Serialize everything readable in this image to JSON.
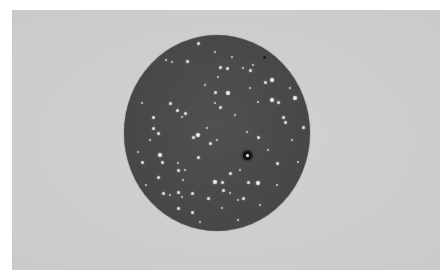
{
  "image": {
    "description": "Black-and-white photograph of a culture plate showing scattered white colonies on a dark circular medium",
    "colors": {
      "page_background": "#ffffff",
      "photo_background": "#cfcfcd",
      "plate": "#4a4a4a",
      "colony": "#eaeaea",
      "dark_spot": "#111111"
    },
    "plate": {
      "center_x": 217,
      "center_y": 133,
      "radius_x": 93,
      "radius_y": 98
    },
    "dark_spot": {
      "x": 247,
      "y": 155
    },
    "speck": {
      "x": 264,
      "y": 57
    },
    "colonies": [
      [
        198,
        43,
        "m"
      ],
      [
        172,
        62,
        "s"
      ],
      [
        187,
        61,
        "m"
      ],
      [
        215,
        52,
        "s"
      ],
      [
        220,
        67,
        "m"
      ],
      [
        227,
        68,
        "m"
      ],
      [
        243,
        68,
        "s"
      ],
      [
        250,
        70,
        "m"
      ],
      [
        218,
        77,
        "s"
      ],
      [
        253,
        65,
        "s"
      ],
      [
        272,
        80,
        "l"
      ],
      [
        265,
        82,
        "m"
      ],
      [
        250,
        88,
        "s"
      ],
      [
        228,
        93,
        "l"
      ],
      [
        215,
        92,
        "m"
      ],
      [
        205,
        85,
        "s"
      ],
      [
        295,
        98,
        "l"
      ],
      [
        272,
        100,
        "l"
      ],
      [
        278,
        102,
        "m"
      ],
      [
        258,
        102,
        "s"
      ],
      [
        170,
        103,
        "m"
      ],
      [
        177,
        110,
        "m"
      ],
      [
        215,
        103,
        "s"
      ],
      [
        220,
        107,
        "m"
      ],
      [
        142,
        103,
        "s"
      ],
      [
        153,
        117,
        "m"
      ],
      [
        182,
        117,
        "s"
      ],
      [
        185,
        113,
        "m"
      ],
      [
        283,
        117,
        "m"
      ],
      [
        285,
        122,
        "m"
      ],
      [
        303,
        127,
        "m"
      ],
      [
        153,
        128,
        "m"
      ],
      [
        158,
        133,
        "m"
      ],
      [
        193,
        137,
        "m"
      ],
      [
        198,
        135,
        "l"
      ],
      [
        207,
        128,
        "s"
      ],
      [
        210,
        143,
        "m"
      ],
      [
        217,
        140,
        "s"
      ],
      [
        247,
        132,
        "s"
      ],
      [
        258,
        137,
        "m"
      ],
      [
        138,
        152,
        "s"
      ],
      [
        160,
        155,
        "l"
      ],
      [
        142,
        162,
        "m"
      ],
      [
        162,
        162,
        "m"
      ],
      [
        178,
        163,
        "s"
      ],
      [
        198,
        157,
        "m"
      ],
      [
        277,
        163,
        "m"
      ],
      [
        298,
        162,
        "s"
      ],
      [
        178,
        170,
        "m"
      ],
      [
        185,
        170,
        "s"
      ],
      [
        230,
        173,
        "m"
      ],
      [
        240,
        170,
        "s"
      ],
      [
        158,
        177,
        "m"
      ],
      [
        183,
        180,
        "s"
      ],
      [
        215,
        182,
        "l"
      ],
      [
        222,
        182,
        "m"
      ],
      [
        248,
        182,
        "m"
      ],
      [
        258,
        183,
        "l"
      ],
      [
        223,
        190,
        "m"
      ],
      [
        230,
        193,
        "s"
      ],
      [
        163,
        193,
        "m"
      ],
      [
        170,
        195,
        "s"
      ],
      [
        178,
        192,
        "m"
      ],
      [
        182,
        197,
        "s"
      ],
      [
        192,
        193,
        "m"
      ],
      [
        208,
        198,
        "m"
      ],
      [
        238,
        200,
        "s"
      ],
      [
        243,
        198,
        "m"
      ],
      [
        178,
        208,
        "m"
      ],
      [
        192,
        212,
        "m"
      ],
      [
        222,
        208,
        "s"
      ],
      [
        238,
        220,
        "s"
      ],
      [
        277,
        185,
        "s"
      ],
      [
        166,
        60,
        "s"
      ],
      [
        232,
        57,
        "s"
      ],
      [
        290,
        88,
        "s"
      ],
      [
        150,
        140,
        "s"
      ],
      [
        268,
        150,
        "s"
      ],
      [
        200,
        222,
        "s"
      ],
      [
        260,
        205,
        "s"
      ],
      [
        292,
        140,
        "s"
      ],
      [
        146,
        185,
        "s"
      ],
      [
        235,
        115,
        "s"
      ]
    ]
  }
}
